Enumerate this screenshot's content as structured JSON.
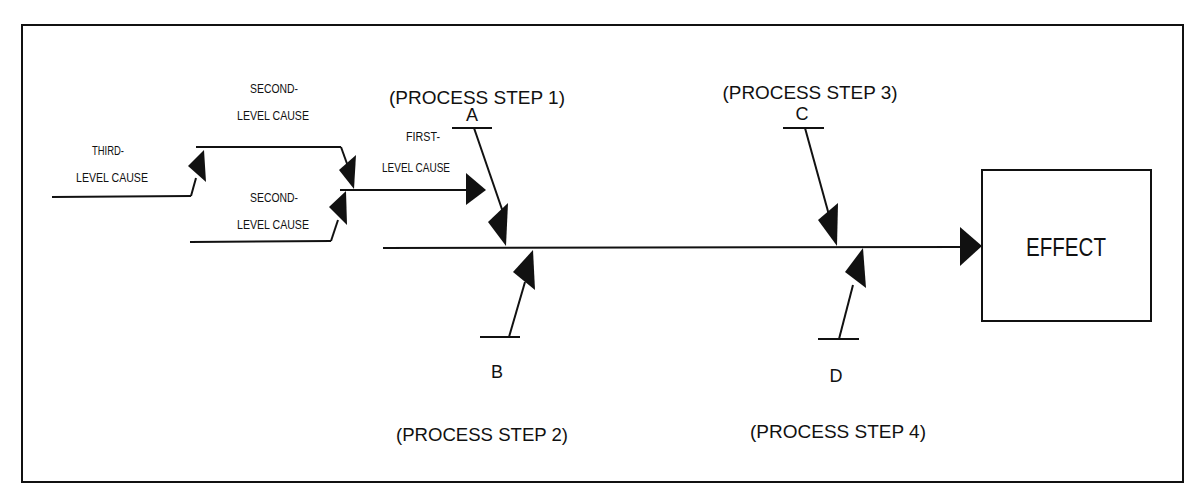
{
  "diagram": {
    "type": "cause-and-effect (fishbone)",
    "effect": {
      "label": "EFFECT"
    },
    "process_steps": [
      {
        "id": "A",
        "letter": "A",
        "label": "(PROCESS STEP 1)",
        "side": "top"
      },
      {
        "id": "B",
        "letter": "B",
        "label": "(PROCESS STEP 2)",
        "side": "bottom"
      },
      {
        "id": "C",
        "letter": "C",
        "label": "(PROCESS STEP 3)",
        "side": "top"
      },
      {
        "id": "D",
        "letter": "D",
        "label": "(PROCESS STEP 4)",
        "side": "bottom"
      }
    ],
    "causes": {
      "first_level": {
        "line1": "FIRST-",
        "line2": "LEVEL CAUSE"
      },
      "second_level_top": {
        "line1": "SECOND-",
        "line2": "LEVEL CAUSE"
      },
      "second_level_bottom": {
        "line1": "SECOND-",
        "line2": "LEVEL CAUSE"
      },
      "third_level": {
        "line1": "THIRD-",
        "line2": "LEVEL CAUSE"
      }
    },
    "colors": {
      "line": "#111111",
      "background": "#ffffff"
    }
  }
}
